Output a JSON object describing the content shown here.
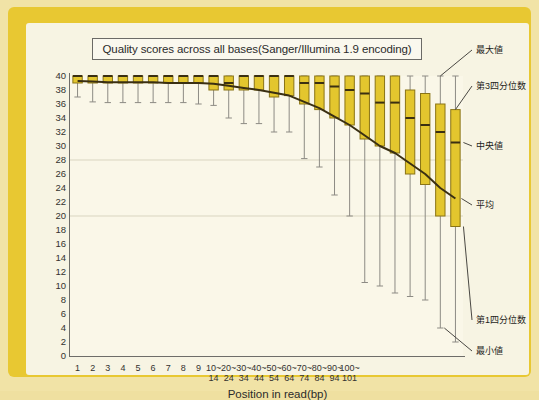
{
  "chart": {
    "title": "Quality scores across all bases(Sanger/Illumina 1.9 encoding)",
    "xlabel": "Position in read(bp)",
    "ylabel": ""
  },
  "annotations": {
    "max": "最大値",
    "q3": "第3四分位数",
    "median": "中央値",
    "mean": "平均",
    "q1": "第1四分位数",
    "min": "最小値"
  },
  "colors": {
    "frame": "#e8c832",
    "panel": "#f7f4e3",
    "plot_bg": "#faf7e8",
    "box_fill": "#e3c62e",
    "box_stroke": "#8a7416",
    "median": "#3a2f12",
    "whisker": "#8d8b84",
    "mean_line": "#3a2f12",
    "grid": "#d9d5c0",
    "axis": "#6e6d69",
    "text": "#2b2b2b"
  },
  "y_axis": {
    "min": 0,
    "max": 40,
    "step": 2,
    "ticks": [
      40,
      38,
      36,
      34,
      32,
      30,
      28,
      26,
      24,
      22,
      20,
      18,
      16,
      14,
      12,
      10,
      8,
      6,
      4,
      2,
      0
    ],
    "gridlines": [
      28,
      20
    ]
  },
  "chart_data": {
    "type": "box",
    "title": "Quality scores across all bases(Sanger/Illumina 1.9 encoding)",
    "xlabel": "Position in read(bp)",
    "ylabel": "Quality score",
    "ylim": [
      0,
      40
    ],
    "grid": true,
    "legend": "none",
    "categories": [
      "1",
      "2",
      "3",
      "4",
      "5",
      "6",
      "7",
      "8",
      "9",
      "10~14",
      "20~24",
      "30~34",
      "40~44",
      "50~54",
      "60~64",
      "70~74",
      "80~84",
      "90~94",
      "100~101"
    ],
    "tick_labels_line1": [
      "1",
      "2",
      "3",
      "4",
      "5",
      "6",
      "7",
      "8",
      "9",
      "10~",
      "20~",
      "30~",
      "40~",
      "50~",
      "60~",
      "70~",
      "80~",
      "90~",
      "100~"
    ],
    "tick_labels_line2": [
      "",
      "",
      "",
      "",
      "",
      "",
      "",
      "",
      "",
      "14",
      "24",
      "34",
      "44",
      "54",
      "64",
      "74",
      "84",
      "94",
      "101"
    ],
    "boxes": [
      {
        "x": "1",
        "min": 37.0,
        "q1": 39.0,
        "median": 40.0,
        "q3": 40.0,
        "max": 40.0,
        "mean": 39.3
      },
      {
        "x": "2",
        "min": 36.3,
        "q1": 39.0,
        "median": 40.0,
        "q3": 40.0,
        "max": 40.0,
        "mean": 39.2
      },
      {
        "x": "3",
        "min": 36.2,
        "q1": 39.0,
        "median": 40.0,
        "q3": 40.0,
        "max": 40.0,
        "mean": 39.1
      },
      {
        "x": "4",
        "min": 36.2,
        "q1": 39.0,
        "median": 40.0,
        "q3": 40.0,
        "max": 40.0,
        "mean": 39.1
      },
      {
        "x": "5",
        "min": 36.2,
        "q1": 39.0,
        "median": 40.0,
        "q3": 40.0,
        "max": 40.0,
        "mean": 39.1
      },
      {
        "x": "6",
        "min": 36.2,
        "q1": 39.0,
        "median": 40.0,
        "q3": 40.0,
        "max": 40.0,
        "mean": 39.1
      },
      {
        "x": "7",
        "min": 36.2,
        "q1": 39.0,
        "median": 40.0,
        "q3": 40.0,
        "max": 40.0,
        "mean": 39.0
      },
      {
        "x": "8",
        "min": 36.2,
        "q1": 39.0,
        "median": 40.0,
        "q3": 40.0,
        "max": 40.0,
        "mean": 39.0
      },
      {
        "x": "9",
        "min": 36.0,
        "q1": 39.0,
        "median": 40.0,
        "q3": 40.0,
        "max": 40.0,
        "mean": 39.0
      },
      {
        "x": "10~14",
        "min": 35.8,
        "q1": 38.0,
        "median": 40.0,
        "q3": 40.0,
        "max": 40.0,
        "mean": 38.9
      },
      {
        "x": "20~24",
        "min": 34.0,
        "q1": 38.0,
        "median": 39.0,
        "q3": 40.0,
        "max": 40.0,
        "mean": 38.6
      },
      {
        "x": "30~34",
        "min": 33.2,
        "q1": 38.0,
        "median": 40.0,
        "q3": 40.0,
        "max": 40.0,
        "mean": 38.3
      },
      {
        "x": "40~44",
        "min": 33.2,
        "q1": 38.0,
        "median": 40.0,
        "q3": 40.0,
        "max": 40.0,
        "mean": 38.0
      },
      {
        "x": "50~54",
        "min": 32.0,
        "q1": 37.0,
        "median": 40.0,
        "q3": 40.0,
        "max": 40.0,
        "mean": 37.6
      },
      {
        "x": "60~64",
        "min": 32.0,
        "q1": 37.2,
        "median": 40.0,
        "q3": 40.0,
        "max": 40.0,
        "mean": 37.2
      },
      {
        "x": "70~74",
        "min": 28.2,
        "q1": 36.0,
        "median": 39.0,
        "q3": 40.0,
        "max": 40.0,
        "mean": 36.3
      },
      {
        "x": "80~84",
        "min": 27.0,
        "q1": 35.2,
        "median": 39.0,
        "q3": 40.0,
        "max": 40.0,
        "mean": 35.4
      },
      {
        "x": "90~94",
        "min": 23.0,
        "q1": 34.0,
        "median": 38.5,
        "q3": 40.0,
        "max": 40.0,
        "mean": 34.2
      },
      {
        "x": "100~101",
        "min": 20.0,
        "q1": 33.0,
        "median": 38.0,
        "q3": 40.0,
        "max": 40.0,
        "mean": 33.0
      },
      {
        "x": "",
        "min": 10.5,
        "q1": 31.0,
        "median": 37.5,
        "q3": 40.0,
        "max": 40.0,
        "mean": 31.5
      },
      {
        "x": "",
        "min": 10.0,
        "q1": 30.0,
        "median": 36.2,
        "q3": 40.0,
        "max": 40.0,
        "mean": 30.0
      },
      {
        "x": "",
        "min": 9.0,
        "q1": 29.0,
        "median": 36.2,
        "q3": 40.0,
        "max": 40.0,
        "mean": 29.0
      },
      {
        "x": "",
        "min": 8.5,
        "q1": 26.0,
        "median": 34.0,
        "q3": 38.0,
        "max": 40.0,
        "mean": 27.5
      },
      {
        "x": "",
        "min": 8.0,
        "q1": 24.5,
        "median": 33.0,
        "q3": 37.5,
        "max": 40.0,
        "mean": 26.0
      },
      {
        "x": "",
        "min": 4.0,
        "q1": 20.0,
        "median": 32.0,
        "q3": 36.0,
        "max": 40.0,
        "mean": 24.0
      },
      {
        "x": "",
        "min": 2.0,
        "q1": 18.5,
        "median": 30.5,
        "q3": 35.2,
        "max": 40.0,
        "mean": 22.5
      }
    ],
    "mean_series_note": "smooth decreasing curve from ~39.3 at position 1 to ~22 at position 101"
  }
}
